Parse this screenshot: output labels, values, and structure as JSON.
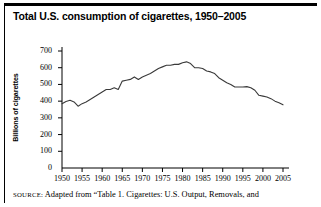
{
  "chart_data": {
    "type": "line",
    "title": "Total U.S. consumption of cigarettes, 1950–2005",
    "xlabel": "",
    "ylabel": "Billions of cigarettes",
    "xlim": [
      1950,
      2005
    ],
    "ylim": [
      0,
      700
    ],
    "grid": false,
    "legend": "none",
    "y_ticks": [
      0,
      100,
      200,
      300,
      400,
      500,
      600,
      700
    ],
    "y_tick_labels": [
      "0",
      "100",
      "200",
      "300",
      "400",
      "500",
      "600",
      "700"
    ],
    "x_ticks": [
      1950,
      1955,
      1960,
      1965,
      1970,
      1975,
      1980,
      1985,
      1990,
      1995,
      2000,
      2005
    ],
    "x_tick_labels": [
      "1950",
      "1955",
      "1960",
      "1965",
      "1970",
      "1975",
      "1980",
      "1985",
      "1990",
      "1995",
      "2000",
      "2005"
    ],
    "line_color": "#3a3a3a",
    "x": [
      1950,
      1951,
      1952,
      1953,
      1954,
      1955,
      1956,
      1957,
      1958,
      1959,
      1960,
      1961,
      1962,
      1963,
      1964,
      1965,
      1966,
      1967,
      1968,
      1969,
      1970,
      1971,
      1972,
      1973,
      1974,
      1975,
      1976,
      1977,
      1978,
      1979,
      1980,
      1981,
      1982,
      1983,
      1984,
      1985,
      1986,
      1987,
      1988,
      1989,
      1990,
      1991,
      1992,
      1993,
      1994,
      1995,
      1996,
      1997,
      1998,
      1999,
      2000,
      2001,
      2002,
      2003,
      2004,
      2005
    ],
    "values": [
      385,
      398,
      405,
      395,
      370,
      385,
      395,
      410,
      425,
      440,
      455,
      470,
      470,
      480,
      470,
      520,
      525,
      530,
      545,
      530,
      545,
      555,
      565,
      580,
      595,
      605,
      615,
      615,
      620,
      620,
      630,
      635,
      625,
      600,
      600,
      595,
      580,
      575,
      565,
      540,
      525,
      510,
      500,
      485,
      485,
      485,
      487,
      480,
      465,
      435,
      430,
      425,
      415,
      400,
      390,
      378
    ],
    "annotations": {
      "peak_year": 1981,
      "peak_value": 635,
      "start_value": 385,
      "end_value": 378
    }
  },
  "source": {
    "label": "SOURCE:",
    "text": " Adapted from “Table 1. Cigarettes: U.S. Output, Removals, and"
  }
}
